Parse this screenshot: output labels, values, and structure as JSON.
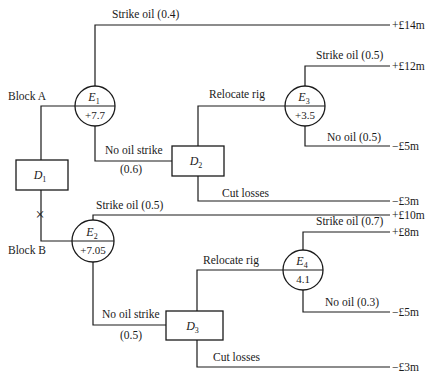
{
  "decision_nodes": [
    {
      "id": "D1",
      "letter": "D",
      "sub": "1",
      "x": 16,
      "y": 160,
      "w": 52,
      "h": 30
    },
    {
      "id": "D2",
      "letter": "D",
      "sub": "2",
      "x": 172,
      "y": 146,
      "w": 52,
      "h": 30
    },
    {
      "id": "D3",
      "letter": "D",
      "sub": "3",
      "x": 166,
      "y": 311,
      "w": 57,
      "h": 29
    }
  ],
  "chance_nodes": [
    {
      "id": "E1",
      "letter": "E",
      "sub": "1",
      "value": "+7.7",
      "cx": 95,
      "cy": 106,
      "r": 20
    },
    {
      "id": "E2",
      "letter": "E",
      "sub": "2",
      "value": "+7.05",
      "cx": 93,
      "cy": 241,
      "r": 21
    },
    {
      "id": "E3",
      "letter": "E",
      "sub": "3",
      "value": "+3.5",
      "cx": 305,
      "cy": 106,
      "r": 20
    },
    {
      "id": "E4",
      "letter": "E",
      "sub": "4",
      "value": "4.1",
      "cx": 303,
      "cy": 270,
      "r": 20
    }
  ],
  "branch_labels": [
    {
      "id": "block-a",
      "text": "Block A",
      "x": 8,
      "y": 100
    },
    {
      "id": "block-b",
      "text": "Block B",
      "x": 8,
      "y": 254
    },
    {
      "id": "e1-strike",
      "text": "Strike oil (0.4)",
      "x": 112,
      "y": 18
    },
    {
      "id": "e1-nostrike",
      "text": "No oil strike",
      "x": 105,
      "y": 154
    },
    {
      "id": "e1-nostrike-p",
      "text": "(0.6)",
      "x": 120,
      "y": 173
    },
    {
      "id": "d2-relocate",
      "text": "Relocate rig",
      "x": 209,
      "y": 98
    },
    {
      "id": "d2-cut",
      "text": "Cut losses",
      "x": 222,
      "y": 197
    },
    {
      "id": "e3-strike",
      "text": "Strike oil (0.5)",
      "x": 316,
      "y": 59
    },
    {
      "id": "e3-nooil",
      "text": "No oil (0.5)",
      "x": 327,
      "y": 141
    },
    {
      "id": "e2-strike",
      "text": "Strike oil (0.5)",
      "x": 96,
      "y": 209
    },
    {
      "id": "e2-nostrike",
      "text": "No oil strike",
      "x": 102,
      "y": 318
    },
    {
      "id": "e2-nostrike-p",
      "text": "(0.5)",
      "x": 120,
      "y": 339
    },
    {
      "id": "d3-relocate",
      "text": "Relocate rig",
      "x": 203,
      "y": 264
    },
    {
      "id": "d3-cut",
      "text": "Cut losses",
      "x": 213,
      "y": 361
    },
    {
      "id": "e4-strike",
      "text": "Strike oil (0.7)",
      "x": 316,
      "y": 225
    },
    {
      "id": "e4-nooil",
      "text": "No oil (0.3)",
      "x": 325,
      "y": 306
    }
  ],
  "outcomes": [
    {
      "id": "e1-strike",
      "text": "+£14m",
      "y": 25
    },
    {
      "id": "e3-strike",
      "text": "+£12m",
      "y": 66
    },
    {
      "id": "e3-nooil",
      "text": "−£5m",
      "y": 146
    },
    {
      "id": "d2-cut",
      "text": "−£3m",
      "y": 201
    },
    {
      "id": "e2-strike",
      "text": "+£10m",
      "y": 215
    },
    {
      "id": "e4-strike",
      "text": "+£8m",
      "y": 232
    },
    {
      "id": "e4-nooil",
      "text": "−£5m",
      "y": 312
    },
    {
      "id": "d3-cut",
      "text": "−£3m",
      "y": 367
    }
  ],
  "rejected_branch_marker": {
    "symbol": "×",
    "x": 40,
    "y": 215
  },
  "edges": [
    "M41 160 L41 106 L75 106",
    "M95 86 L95 25 L390 25",
    "M95 126 L95 161 L172 161",
    "M198 146 L198 106 L285 106",
    "M305 86 L305 66 L390 66",
    "M305 126 L305 146 L390 146",
    "M198 176 L198 201 L390 201",
    "M41 190 L41 241 L72 241",
    "M93 220 L93 215 L390 215",
    "M93 262 L93 325 L166 325",
    "M197 311 L197 270 L283 270",
    "M303 250 L303 232 L390 232",
    "M303 290 L303 312 L390 312",
    "M197 340 L197 367 L390 367"
  ]
}
